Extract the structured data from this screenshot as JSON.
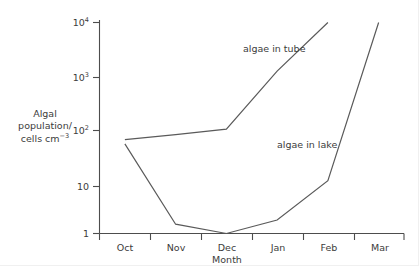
{
  "chart_data": {
    "type": "line",
    "title": "",
    "xlabel": "Month",
    "ylabel_lines": [
      "Algal",
      "population/",
      "cells cm"
    ],
    "ylabel_superscript": "−3",
    "ylabel_full": "Algal population/ cells cm−3",
    "yscale": "log",
    "ylim": [
      1,
      10000
    ],
    "grid": false,
    "legend_position": "inline-annotations",
    "categories": [
      "Oct",
      "Nov",
      "Dec",
      "Jan",
      "Feb",
      "Mar"
    ],
    "ytick_labels": [
      "1",
      "10",
      "10²",
      "10³",
      "10⁴"
    ],
    "ytick_values": [
      1,
      10,
      100,
      1000,
      10000
    ],
    "ytick_bases": [
      "1",
      "10",
      "10",
      "10",
      "10"
    ],
    "ytick_exponents": [
      "",
      "",
      "2",
      "3",
      "4"
    ],
    "series": [
      {
        "name": "algae in tube",
        "label": "algae in tube",
        "x": [
          "Oct",
          "Nov",
          "Dec",
          "Jan",
          "Feb"
        ],
        "values": [
          60,
          75,
          95,
          1200,
          10000
        ]
      },
      {
        "name": "algae in lake",
        "label": "algae in lake",
        "x": [
          "Oct",
          "Nov",
          "Dec",
          "Jan",
          "Feb",
          "Mar"
        ],
        "values": [
          50,
          1.5,
          1.0,
          1.8,
          10,
          10000
        ]
      }
    ]
  },
  "axes": {
    "x_axis_name": "Month",
    "y_axis_name": "Algal population/ cells cm−3"
  },
  "annotations": {
    "tube_label": "algae in tube",
    "lake_label": "algae in lake"
  },
  "colors": {
    "background": "#ffffff",
    "axis": "#4d4d4d",
    "line": "#5a5a5a",
    "text": "#3c3c3c"
  },
  "ticks": {
    "months": [
      "Oct",
      "Nov",
      "Dec",
      "Jan",
      "Feb",
      "Mar"
    ]
  }
}
